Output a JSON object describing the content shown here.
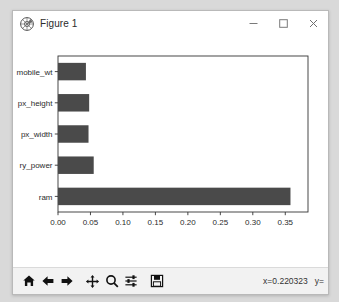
{
  "window": {
    "title": "Figure 1",
    "icon": "matplotlib-icon",
    "buttons": {
      "minimize": "minimize-icon",
      "maximize": "maximize-icon",
      "close": "close-icon"
    }
  },
  "toolbar": {
    "home_label": "home-icon",
    "back_label": "back-arrow-icon",
    "forward_label": "forward-arrow-icon",
    "pan_label": "pan-move-icon",
    "zoom_label": "zoom-magnifier-icon",
    "subplots_label": "configure-subplots-icon",
    "save_label": "save-floppy-icon",
    "coord_x": "x=0.220323",
    "coord_y": "y="
  },
  "chart_data": {
    "type": "bar",
    "orientation": "horizontal",
    "title": "",
    "xlabel": "",
    "ylabel": "",
    "categories": [
      "mobile_wt",
      "px_height",
      "px_width",
      "battery_power",
      "ram"
    ],
    "category_display": [
      "mobile_wt",
      "px_height",
      "px_width",
      "ry_power",
      "ram"
    ],
    "values": [
      0.043,
      0.048,
      0.047,
      0.055,
      0.358
    ],
    "xlim": [
      0.0,
      0.385
    ],
    "xticks": [
      0.0,
      0.05,
      0.1,
      0.15,
      0.2,
      0.25,
      0.3,
      0.35
    ],
    "xticklabels": [
      "0.00",
      "0.05",
      "0.10",
      "0.15",
      "0.20",
      "0.25",
      "0.30",
      "0.35"
    ],
    "bar_color": "#4a4a4a",
    "grid": false,
    "legend": null,
    "facecolor": "#ffffff"
  }
}
